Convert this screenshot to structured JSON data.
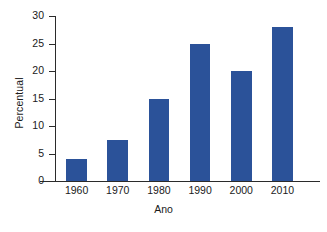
{
  "chart_data": {
    "type": "bar",
    "title": "",
    "subtitle": "",
    "xlabel": "Ano",
    "ylabel": "Percentual",
    "categories": [
      "1960",
      "1970",
      "1980",
      "1990",
      "2000",
      "2010"
    ],
    "values": [
      4,
      7.5,
      15,
      25,
      20,
      28
    ],
    "series": [
      {
        "name": "Percentual",
        "values": [
          4,
          7.5,
          15,
          25,
          20,
          28
        ]
      }
    ],
    "ylim": [
      0,
      30
    ],
    "yticks": [
      "0",
      "5",
      "10",
      "15",
      "20",
      "25",
      "30"
    ],
    "ytick_values": [
      0,
      5,
      10,
      15,
      20,
      25,
      30
    ],
    "grid": false,
    "legend": false,
    "legend_position": "none",
    "bar_color": "#2b5299",
    "axis_color": "#2b2b2b",
    "background_color": "#ffffff",
    "annotations": []
  },
  "figure": {
    "caption_remnant": ""
  }
}
